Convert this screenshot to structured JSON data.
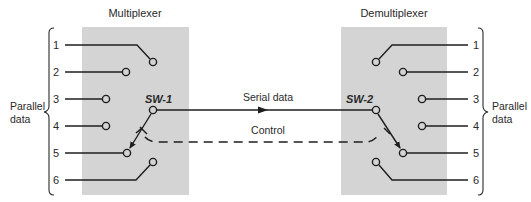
{
  "diagram": {
    "multiplexer": {
      "title": "Multiplexer",
      "switch_label": "SW-1",
      "inputs": [
        "1",
        "2",
        "3",
        "4",
        "5",
        "6"
      ]
    },
    "demultiplexer": {
      "title": "Demultiplexer",
      "switch_label": "SW-2",
      "outputs": [
        "1",
        "2",
        "3",
        "4",
        "5",
        "6"
      ]
    },
    "left_group_label": [
      "Parallel",
      "data"
    ],
    "right_group_label": [
      "Parallel",
      "data"
    ],
    "serial_link_label": "Serial data",
    "control_link_label": "Control",
    "selected_channel": "5",
    "colors": {
      "box_fill": "#d4d4d4",
      "line": "#1e1e1e",
      "background": "#ffffff"
    }
  }
}
